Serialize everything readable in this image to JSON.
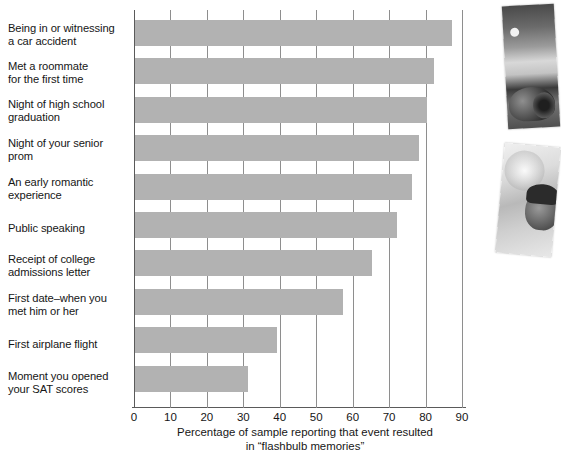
{
  "chart_data": {
    "type": "bar",
    "orientation": "horizontal",
    "title": "",
    "xlabel": "Percentage of sample reporting that event resulted in \"flashbulb memories\"",
    "ylabel": "",
    "xlim": [
      0,
      90
    ],
    "xticks": [
      0,
      10,
      20,
      30,
      40,
      50,
      60,
      70,
      80,
      90
    ],
    "grid": true,
    "legend": false,
    "bar_color": "#b2b2b2",
    "categories": [
      "Being in or witnessing a car accident",
      "Met a roommate for the first time",
      "Night of high school graduation",
      "Night of your senior prom",
      "An early romantic experience",
      "Public speaking",
      "Receipt of college admissions letter",
      "First date–when you met him or her",
      "First airplane flight",
      "Moment you opened your SAT scores"
    ],
    "values": [
      87,
      82,
      80,
      78,
      76,
      72,
      65,
      57,
      39,
      31
    ]
  },
  "axis": {
    "title_line1": "Percentage of sample reporting that event resulted",
    "title_line2": "in “flashbulb memories”",
    "tick_labels": [
      "0",
      "10",
      "20",
      "30",
      "40",
      "50",
      "60",
      "70",
      "80",
      "90"
    ]
  },
  "categories": [
    {
      "line1": "Being in or witnessing",
      "line2": "a car accident"
    },
    {
      "line1": "Met a roommate",
      "line2": "for the first time"
    },
    {
      "line1": "Night of high school",
      "line2": "graduation"
    },
    {
      "line1": "Night of your senior",
      "line2": "prom"
    },
    {
      "line1": "An early romantic",
      "line2": "experience"
    },
    {
      "line1": "Public speaking",
      "line2": ""
    },
    {
      "line1": "Receipt of college",
      "line2": "admissions letter"
    },
    {
      "line1": "First date–when you",
      "line2": "met him or her"
    },
    {
      "line1": "First airplane flight",
      "line2": ""
    },
    {
      "line1": "Moment you opened",
      "line2": "your SAT scores"
    }
  ],
  "photos": [
    {
      "name": "car-accident-photo",
      "caption": ""
    },
    {
      "name": "person-outdoors-photo",
      "caption": ""
    }
  ]
}
